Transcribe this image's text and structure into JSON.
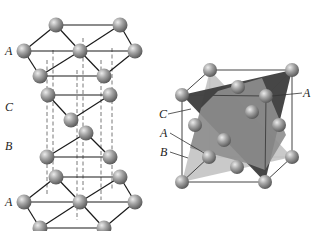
{
  "figure": {
    "left_panel": {
      "title": "hcp-like stacking view (ABCA)",
      "labels": [
        {
          "text": "A",
          "x": 5,
          "y": 55
        },
        {
          "text": "C",
          "x": 5,
          "y": 111
        },
        {
          "text": "B",
          "x": 5,
          "y": 150
        },
        {
          "text": "A",
          "x": 5,
          "y": 206
        }
      ]
    },
    "right_panel": {
      "title": "FCC unit cell with close-packed planes",
      "labels": [
        {
          "text": "C",
          "x": 159,
          "y": 118
        },
        {
          "text": "A",
          "x": 160,
          "y": 137
        },
        {
          "text": "B",
          "x": 160,
          "y": 156
        },
        {
          "text": "A",
          "x": 303,
          "y": 97
        }
      ]
    },
    "colors": {
      "atom_fill": "#9a9a9a",
      "atom_highlight": "#e6e6e6",
      "plane_light": "#c4c4c4",
      "plane_mid": "#8c8c8c",
      "plane_dark": "#3a3a3a",
      "background": "#ffffff"
    }
  }
}
